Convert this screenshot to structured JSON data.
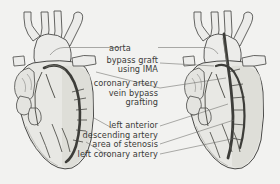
{
  "figure": {
    "name": "coronary-artery-bypass-graft-diagram",
    "background_color": "#f2f2f0",
    "ink_color": "#3a3a38",
    "vessel_color": "#4a4a48",
    "heart_fill": "#e8e8e4",
    "shadow_fill": "#d8d8d2"
  },
  "labels": {
    "aorta": "aorta",
    "bypass_graft_line1": "bypass graft",
    "bypass_graft_line2": "using IMA",
    "cabg_line1": "coronary artery",
    "cabg_line2": "vein bypass",
    "cabg_line3": "grafting",
    "lad_line1": "left anterior",
    "lad_line2": "descending artery",
    "stenosis": "area of stenosis",
    "lca": "left coronary artery"
  },
  "panels": {
    "left": {
      "name": "heart-with-vein-bypass-graft",
      "caption": "coronary artery vein bypass grafting"
    },
    "right": {
      "name": "heart-with-ima-bypass-graft",
      "caption": "bypass graft using IMA"
    }
  }
}
